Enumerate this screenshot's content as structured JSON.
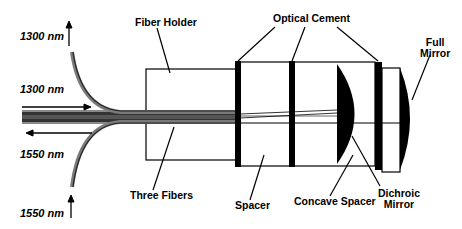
{
  "diagram": {
    "type": "optical-component-schematic",
    "labels": {
      "fiber_holder": "Fiber Holder",
      "optical_cement": "Optical Cement",
      "full_mirror_line1": "Full",
      "full_mirror_line2": "Mirror",
      "three_fibers": "Three Fibers",
      "spacer": "Spacer",
      "concave_spacer": "Concave Spacer",
      "dichroic_mirror_line1": "Dichroic",
      "dichroic_mirror_line2": "Mirror"
    },
    "wavelengths": {
      "top_output": "1300 nm",
      "input": "1300 nm",
      "output": "1550 nm",
      "bottom_input": "1550 nm"
    },
    "colors": {
      "ink": "#000000",
      "fiber_gray": "#6e6e6e",
      "background": "#ffffff"
    }
  }
}
